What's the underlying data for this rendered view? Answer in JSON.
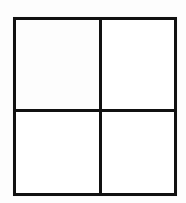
{
  "figure": {
    "canvas": {
      "width": 186,
      "height": 203,
      "background_color": "#fdfdfd"
    },
    "square": {
      "left": 13,
      "top": 17,
      "width": 164,
      "height": 179,
      "border_width": 3,
      "border_color": "#111111",
      "fill_color": "#ffffff"
    },
    "dividers": [
      {
        "name": "vertical-divider",
        "orientation": "vertical",
        "position": 99,
        "thickness": 3,
        "color": "#111111"
      },
      {
        "name": "horizontal-divider",
        "orientation": "horizontal",
        "position": 109,
        "thickness": 3,
        "color": "#111111"
      }
    ],
    "cells": [
      {
        "name": "top-left",
        "label": "",
        "left": 16,
        "top": 20,
        "width": 83,
        "height": 89,
        "fill": "#fdfdfd"
      },
      {
        "name": "top-right",
        "label": "",
        "left": 102,
        "top": 20,
        "width": 72,
        "height": 89,
        "fill": "#ffffff"
      },
      {
        "name": "bottom-left",
        "label": "",
        "left": 16,
        "top": 112,
        "width": 83,
        "height": 81,
        "fill": "#ffffff"
      },
      {
        "name": "bottom-right",
        "label": "",
        "left": 102,
        "top": 112,
        "width": 72,
        "height": 81,
        "fill": "#ffffff"
      }
    ]
  }
}
